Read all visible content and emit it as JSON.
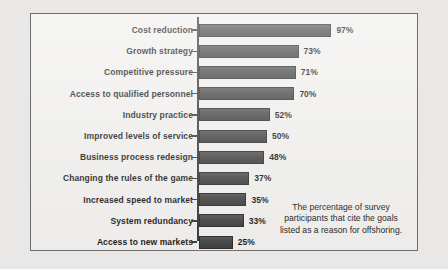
{
  "chart_data": {
    "type": "bar",
    "orientation": "horizontal",
    "title": "",
    "xlabel": "",
    "ylabel": "",
    "xlim": [
      0,
      100
    ],
    "grid": false,
    "legend": null,
    "value_suffix": "%",
    "categories": [
      "Cost reduction",
      "Growth strategy",
      "Competitive pressure",
      "Access to qualified personnel",
      "Industry practice",
      "Improved levels of service",
      "Business process redesign",
      "Changing the rules of the game",
      "Increased speed to market",
      "System redundancy",
      "Access to new markets"
    ],
    "values": [
      97,
      73,
      71,
      70,
      52,
      50,
      48,
      37,
      35,
      33,
      25
    ],
    "data_labels": [
      "97%",
      "73%",
      "71%",
      "70%",
      "52%",
      "50%",
      "48%",
      "37%",
      "35%",
      "33%",
      "25%"
    ],
    "bar_color": "#4b4b4b",
    "bar_edge_color": "#2e2e2e",
    "plot_background": "#f1f0ee",
    "page_background": "#e9e8e6",
    "axis_color": "#3a3a3a",
    "annotation": "The percentage of survey participants that cite the goals listed as a reason for offshoring."
  }
}
